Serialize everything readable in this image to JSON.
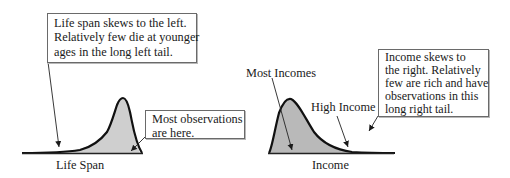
{
  "left_panel": {
    "callout_lines": [
      "Life span skews to the left.",
      "Relatively few die at younger",
      "ages in the long left tail."
    ],
    "observations_lines": [
      "Most observations",
      "are here."
    ],
    "axis_label": "Life Span",
    "skew": "left",
    "fill_color": "#cfcfcf"
  },
  "right_panel": {
    "label_peak": "Most Incomes",
    "label_tail": "High Income",
    "callout_lines": [
      "Income skews to",
      "the right. Relatively",
      "few are rich and have",
      "observations in this",
      "long right tail."
    ],
    "axis_label": "Income",
    "skew": "right",
    "fill_color": "#b9b9b9"
  }
}
